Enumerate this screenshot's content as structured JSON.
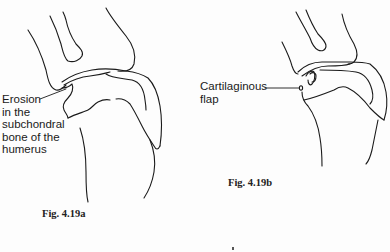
{
  "figures": [
    {
      "id": "4.19a",
      "caption": "Fig. 4.19a",
      "label": "Erosion\nin the\nsubchondral\nbone of the\nhumerus"
    },
    {
      "id": "4.19b",
      "caption": "Fig. 4.19b",
      "label": "Cartilaginous\nflap"
    }
  ],
  "colors": {
    "line": "#1a1a1a",
    "background": "#fdfdfd"
  }
}
